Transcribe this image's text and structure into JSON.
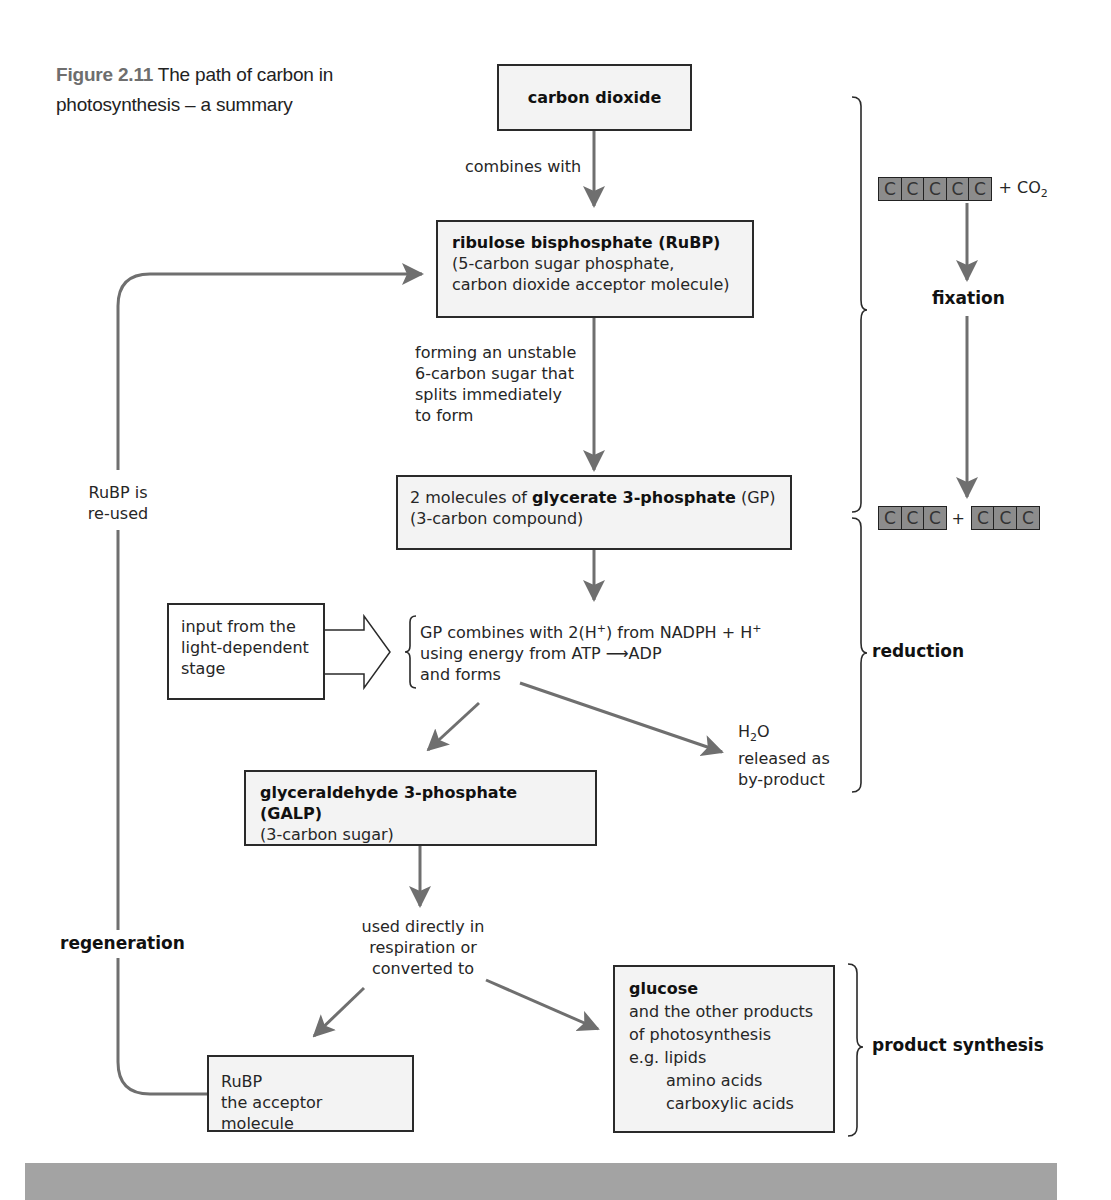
{
  "figure": {
    "number": "Figure 2.11",
    "title": "The path of carbon in photosynthesis – a summary"
  },
  "nodes": {
    "carbon_dioxide": {
      "title": "carbon dioxide"
    },
    "rubp": {
      "title": "ribulose bisphosphate (RuBP)",
      "line1": "(5-carbon sugar phosphate,",
      "line2": "carbon dioxide acceptor molecule)"
    },
    "gp": {
      "prefix": "2 molecules of ",
      "title": "glycerate 3-phosphate",
      "suffix": " (GP)",
      "line2": "(3-carbon compound)"
    },
    "light_input": {
      "line1": "input from the",
      "line2": "light-dependent",
      "line3": "stage"
    },
    "galp": {
      "title": "glyceraldehyde 3-phosphate (GALP)",
      "line2": "(3-carbon sugar)"
    },
    "rubp_acceptor": {
      "line1": "RuBP",
      "line2": "the acceptor molecule"
    },
    "glucose": {
      "title": "glucose",
      "line1": "and the other products",
      "line2": "of photosynthesis",
      "line3": "e.g. lipids",
      "line4": "amino acids",
      "line5": "carboxylic acids"
    }
  },
  "edge_labels": {
    "combines_with": "combines with",
    "forming": [
      "forming an unstable",
      "6-carbon sugar that",
      "splits immediately",
      "to form"
    ],
    "gp_reaction": {
      "line1_a": "GP combines with 2(H",
      "line1_sup": "+",
      "line1_b": ") from NADPH + H",
      "line1_sup2": "+",
      "line2_a": "using energy from ATP ",
      "line2_arrow": "⟶",
      "line2_b": "ADP",
      "line3": "and forms"
    },
    "water": {
      "h": "H",
      "sub": "2",
      "o": "O",
      "line2": "released as",
      "line3": "by-product"
    },
    "used_directly": [
      "used directly in",
      "respiration or",
      "converted to"
    ],
    "rubp_reused": [
      "RuBP is",
      "re-used"
    ]
  },
  "stages": {
    "fixation": "fixation",
    "reduction": "reduction",
    "regeneration": "regeneration",
    "product_synthesis": "product synthesis"
  },
  "carbon_chain": {
    "atom": "C",
    "co2_prefix": "+ CO",
    "co2_sub": "2",
    "plus": "+"
  },
  "colors": {
    "arrow": "#6f6f6f",
    "box_fill": "#f3f3f3",
    "box_border": "#2a2a2a",
    "carbon_fill": "#8c8c8c",
    "footer_bar": "#a3a3a3"
  }
}
